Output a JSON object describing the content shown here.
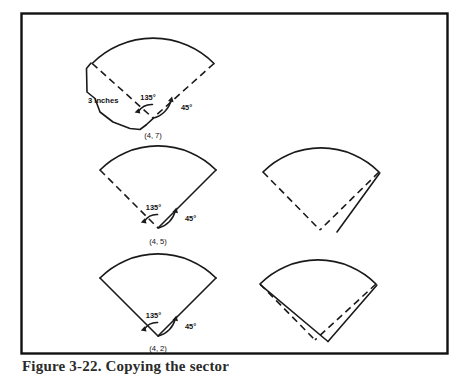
{
  "figure": {
    "caption": "Figure 3-22. Copying the sector",
    "background_color": "#ffffff",
    "ink_color": "#1a1a1a",
    "border_color": "#111111"
  },
  "labels": {
    "angle_135": "135°",
    "angle_45": "45°",
    "dimension_3_inches": "3 inches",
    "coord_top": "(4, 7)",
    "coord_middle": "(4, 5)",
    "coord_bottom": "(4, 2)"
  },
  "panels": [
    {
      "id": "top-left",
      "name": "sector-with-offset-band",
      "apex_label": "(4, 7)",
      "angles": [
        "135°",
        "45°"
      ],
      "dimension": "3 inches",
      "left_edge_style": "dashed",
      "right_edge_style": "dashed",
      "has_offset_band": true
    },
    {
      "id": "middle-left",
      "name": "sector-dashed-left-solid-right",
      "apex_label": "(4, 5)",
      "angles": [
        "135°",
        "45°"
      ],
      "left_edge_style": "dashed",
      "right_edge_style": "solid",
      "has_offset_band": false
    },
    {
      "id": "middle-right",
      "name": "sector-copy-offset-single",
      "apex_label": "",
      "angles": [],
      "left_edge_style": "dashed",
      "right_edge_style": "dashed",
      "has_offset_band": true
    },
    {
      "id": "bottom-left",
      "name": "sector-solid-both-edges",
      "apex_label": "(4, 2)",
      "angles": [
        "135°",
        "45°"
      ],
      "left_edge_style": "solid",
      "right_edge_style": "solid",
      "has_offset_band": false
    },
    {
      "id": "bottom-right",
      "name": "sector-copy-rotated-overlap",
      "apex_label": "",
      "angles": [],
      "left_edge_style": "dashed",
      "right_edge_style": "dashed",
      "has_offset_band": true
    }
  ]
}
